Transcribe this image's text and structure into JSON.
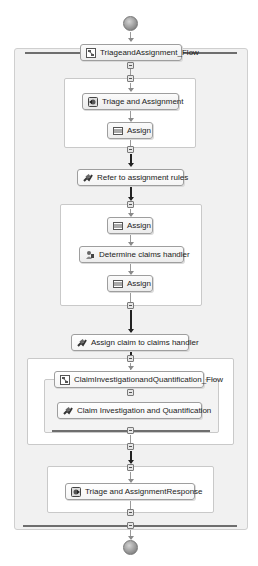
{
  "diagram": {
    "start_node": {
      "shape": "circle",
      "label": ""
    },
    "end_node": {
      "shape": "circle",
      "label": ""
    },
    "outer_flow": {
      "label": "TriageandAssignment_Flow",
      "icon": "flow-icon"
    },
    "sections": [
      {
        "id": "sequence-1",
        "nodes": [
          {
            "label": "Triage and Assignment",
            "icon": "receive-icon"
          },
          {
            "label": "Assign",
            "icon": "assign-icon"
          }
        ]
      },
      {
        "id": "standalone-1",
        "nodes": [
          {
            "label": "Refer to assignment rules",
            "icon": "invoke-icon"
          }
        ]
      },
      {
        "id": "sequence-2",
        "nodes": [
          {
            "label": "Assign",
            "icon": "assign-icon"
          },
          {
            "label": "Determine claims handler",
            "icon": "human-task-icon"
          },
          {
            "label": "Assign",
            "icon": "assign-icon"
          }
        ]
      },
      {
        "id": "standalone-2",
        "nodes": [
          {
            "label": "Assign claim to claims handler",
            "icon": "invoke-icon"
          }
        ]
      },
      {
        "id": "sequence-3",
        "inner_flow": {
          "label": "ClaimInvestigationandQuantification_Flow",
          "icon": "flow-icon"
        },
        "nodes": [
          {
            "label": "Claim Investigation and Quantification",
            "icon": "invoke-icon"
          }
        ]
      },
      {
        "id": "sequence-4",
        "nodes": [
          {
            "label": "Triage and AssignmentResponse",
            "icon": "reply-icon"
          }
        ]
      }
    ]
  }
}
